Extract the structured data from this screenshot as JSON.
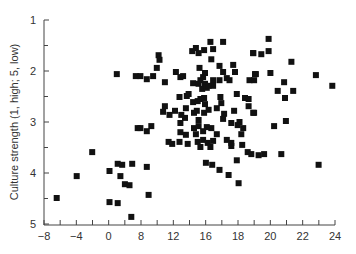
{
  "chart_data": {
    "type": "scatter",
    "title": "",
    "xlabel": "",
    "ylabel": "Culture strength (1, high; 5, low)",
    "xlim": [
      -8,
      24
    ],
    "ylim": [
      1,
      5
    ],
    "y_inverted": true,
    "grid": false,
    "legend": null,
    "marker": "filled-square",
    "marker_color": "#111111",
    "x_tick_labels": [
      "-8",
      "-4",
      "0",
      "8",
      "12",
      "16",
      "18",
      "20",
      "22",
      "24"
    ],
    "y_tick_labels": [
      "1",
      "2",
      "3",
      "4",
      "5"
    ],
    "points": [
      {
        "x": -6.6,
        "y": 4.49
      },
      {
        "x": -4.4,
        "y": 4.06
      },
      {
        "x": -2.7,
        "y": 3.59
      },
      {
        "x": -0.8,
        "y": 3.96
      },
      {
        "x": -0.8,
        "y": 4.57
      },
      {
        "x": 0.0,
        "y": 2.06
      },
      {
        "x": 0.1,
        "y": 3.82
      },
      {
        "x": 0.1,
        "y": 4.59
      },
      {
        "x": 0.4,
        "y": 4.06
      },
      {
        "x": 0.6,
        "y": 3.84
      },
      {
        "x": 0.9,
        "y": 4.22
      },
      {
        "x": 1.4,
        "y": 4.24
      },
      {
        "x": 1.6,
        "y": 4.86
      },
      {
        "x": 1.7,
        "y": 3.82
      },
      {
        "x": 2.1,
        "y": 2.1
      },
      {
        "x": 2.6,
        "y": 2.1
      },
      {
        "x": 3.3,
        "y": 2.16
      },
      {
        "x": 3.3,
        "y": 3.88
      },
      {
        "x": 3.8,
        "y": 3.08
      },
      {
        "x": 3.5,
        "y": 4.43
      },
      {
        "x": 4.6,
        "y": 1.69
      },
      {
        "x": 4.7,
        "y": 1.78
      },
      {
        "x": 4.4,
        "y": 1.94
      },
      {
        "x": 4.0,
        "y": 2.1
      },
      {
        "x": 5.3,
        "y": 2.22
      },
      {
        "x": 6.5,
        "y": 2.02
      },
      {
        "x": 7.0,
        "y": 2.12
      },
      {
        "x": 7.3,
        "y": 2.1
      },
      {
        "x": 8.3,
        "y": 1.61
      },
      {
        "x": 8.7,
        "y": 1.55
      },
      {
        "x": 9.0,
        "y": 1.65
      },
      {
        "x": 9.1,
        "y": 1.94
      },
      {
        "x": 9.2,
        "y": 2.18
      },
      {
        "x": 8.4,
        "y": 2.24
      },
      {
        "x": 9.0,
        "y": 2.25
      },
      {
        "x": 9.4,
        "y": 2.35
      },
      {
        "x": 7.9,
        "y": 2.45
      },
      {
        "x": 6.9,
        "y": 2.51
      },
      {
        "x": 7.7,
        "y": 2.49
      },
      {
        "x": 8.4,
        "y": 2.61
      },
      {
        "x": 8.9,
        "y": 2.59
      },
      {
        "x": 9.2,
        "y": 2.55
      },
      {
        "x": 5.3,
        "y": 2.69
      },
      {
        "x": 5.1,
        "y": 2.8
      },
      {
        "x": 5.8,
        "y": 2.86
      },
      {
        "x": 6.4,
        "y": 2.78
      },
      {
        "x": 7.1,
        "y": 2.86
      },
      {
        "x": 7.5,
        "y": 2.92
      },
      {
        "x": 8.5,
        "y": 2.82
      },
      {
        "x": 8.8,
        "y": 2.78
      },
      {
        "x": 7.6,
        "y": 2.73
      },
      {
        "x": 9.0,
        "y": 2.96
      },
      {
        "x": 2.3,
        "y": 3.12
      },
      {
        "x": 3.3,
        "y": 3.18
      },
      {
        "x": 2.6,
        "y": 3.12
      },
      {
        "x": 7.0,
        "y": 3.02
      },
      {
        "x": 8.5,
        "y": 3.12
      },
      {
        "x": 9.0,
        "y": 3.08
      },
      {
        "x": 7.0,
        "y": 3.2
      },
      {
        "x": 7.6,
        "y": 3.25
      },
      {
        "x": 8.7,
        "y": 3.24
      },
      {
        "x": 5.7,
        "y": 3.39
      },
      {
        "x": 6.1,
        "y": 3.43
      },
      {
        "x": 6.9,
        "y": 3.39
      },
      {
        "x": 7.8,
        "y": 3.43
      },
      {
        "x": 8.9,
        "y": 3.39
      },
      {
        "x": 9.2,
        "y": 3.49
      },
      {
        "x": 10.3,
        "y": 1.43
      },
      {
        "x": 10.6,
        "y": 1.57
      },
      {
        "x": 11.7,
        "y": 1.43
      },
      {
        "x": 10.4,
        "y": 1.77
      },
      {
        "x": 9.6,
        "y": 1.59
      },
      {
        "x": 11.3,
        "y": 1.9
      },
      {
        "x": 11.7,
        "y": 2.02
      },
      {
        "x": 12.8,
        "y": 1.88
      },
      {
        "x": 13.0,
        "y": 2.02
      },
      {
        "x": 15.0,
        "y": 1.65
      },
      {
        "x": 15.3,
        "y": 2.06
      },
      {
        "x": 9.7,
        "y": 2.04
      },
      {
        "x": 9.5,
        "y": 2.12
      },
      {
        "x": 9.7,
        "y": 2.25
      },
      {
        "x": 10.6,
        "y": 2.18
      },
      {
        "x": 11.3,
        "y": 2.18
      },
      {
        "x": 12.1,
        "y": 2.14
      },
      {
        "x": 12.4,
        "y": 2.18
      },
      {
        "x": 10.6,
        "y": 2.29
      },
      {
        "x": 9.9,
        "y": 2.33
      },
      {
        "x": 14.6,
        "y": 2.18
      },
      {
        "x": 15.1,
        "y": 2.18
      },
      {
        "x": 10.1,
        "y": 2.29
      },
      {
        "x": 9.6,
        "y": 2.53
      },
      {
        "x": 9.7,
        "y": 2.65
      },
      {
        "x": 11.4,
        "y": 2.51
      },
      {
        "x": 11.5,
        "y": 2.63
      },
      {
        "x": 11.0,
        "y": 2.73
      },
      {
        "x": 13.2,
        "y": 2.45
      },
      {
        "x": 14.1,
        "y": 2.53
      },
      {
        "x": 14.5,
        "y": 2.55
      },
      {
        "x": 14.5,
        "y": 2.69
      },
      {
        "x": 15.0,
        "y": 2.82
      },
      {
        "x": 9.6,
        "y": 2.82
      },
      {
        "x": 10.1,
        "y": 2.76
      },
      {
        "x": 11.8,
        "y": 2.84
      },
      {
        "x": 11.7,
        "y": 2.94
      },
      {
        "x": 12.9,
        "y": 2.78
      },
      {
        "x": 13.5,
        "y": 3.0
      },
      {
        "x": 13.3,
        "y": 3.06
      },
      {
        "x": 12.6,
        "y": 3.02
      },
      {
        "x": 13.9,
        "y": 3.12
      },
      {
        "x": 13.7,
        "y": 3.24
      },
      {
        "x": 10.4,
        "y": 3.12
      },
      {
        "x": 9.9,
        "y": 3.1
      },
      {
        "x": 9.5,
        "y": 3.18
      },
      {
        "x": 9.5,
        "y": 3.35
      },
      {
        "x": 11.0,
        "y": 3.24
      },
      {
        "x": 10.6,
        "y": 3.37
      },
      {
        "x": 12.1,
        "y": 3.35
      },
      {
        "x": 12.6,
        "y": 3.41
      },
      {
        "x": 13.8,
        "y": 3.45
      },
      {
        "x": 10.0,
        "y": 3.41
      },
      {
        "x": 10.3,
        "y": 3.49
      },
      {
        "x": 12.6,
        "y": 3.47
      },
      {
        "x": 14.4,
        "y": 3.59
      },
      {
        "x": 14.8,
        "y": 3.63
      },
      {
        "x": 15.6,
        "y": 3.65
      },
      {
        "x": 13.2,
        "y": 3.75
      },
      {
        "x": 9.8,
        "y": 3.8
      },
      {
        "x": 10.5,
        "y": 3.84
      },
      {
        "x": 11.3,
        "y": 3.94
      },
      {
        "x": 12.3,
        "y": 4.04
      },
      {
        "x": 13.4,
        "y": 4.2
      },
      {
        "x": 16.7,
        "y": 1.37
      },
      {
        "x": 15.0,
        "y": 1.65
      },
      {
        "x": 15.9,
        "y": 1.67
      },
      {
        "x": 16.7,
        "y": 1.61
      },
      {
        "x": 19.2,
        "y": 1.82
      },
      {
        "x": 15.2,
        "y": 2.06
      },
      {
        "x": 16.9,
        "y": 2.04
      },
      {
        "x": 18.4,
        "y": 2.22
      },
      {
        "x": 17.7,
        "y": 2.39
      },
      {
        "x": 19.4,
        "y": 2.39
      },
      {
        "x": 18.5,
        "y": 2.53
      },
      {
        "x": 21.9,
        "y": 2.08
      },
      {
        "x": 23.7,
        "y": 2.29
      },
      {
        "x": 15.1,
        "y": 2.82
      },
      {
        "x": 17.3,
        "y": 3.08
      },
      {
        "x": 18.6,
        "y": 2.98
      },
      {
        "x": 16.2,
        "y": 3.63
      },
      {
        "x": 18.1,
        "y": 3.63
      },
      {
        "x": 22.2,
        "y": 3.84
      }
    ]
  }
}
